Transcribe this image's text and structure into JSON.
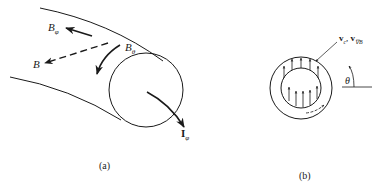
{
  "figure": {
    "panel_a": {
      "caption": "(a)",
      "labels": {
        "b_phi": {
          "main": "B",
          "sub": "φ"
        },
        "b": {
          "main": "B"
        },
        "b_theta": {
          "main": "B",
          "sub": "θ"
        },
        "i_phi": {
          "main": "I",
          "sub": "φ"
        }
      }
    },
    "panel_b": {
      "caption": "(b)",
      "labels": {
        "velocity": {
          "v1": "v",
          "v1_sub": "c",
          "sep": ", ",
          "v2": "v",
          "v2_sub": "∇B"
        },
        "theta": "θ"
      }
    },
    "colors": {
      "stroke": "#1a1a1a",
      "background": "#ffffff"
    }
  }
}
